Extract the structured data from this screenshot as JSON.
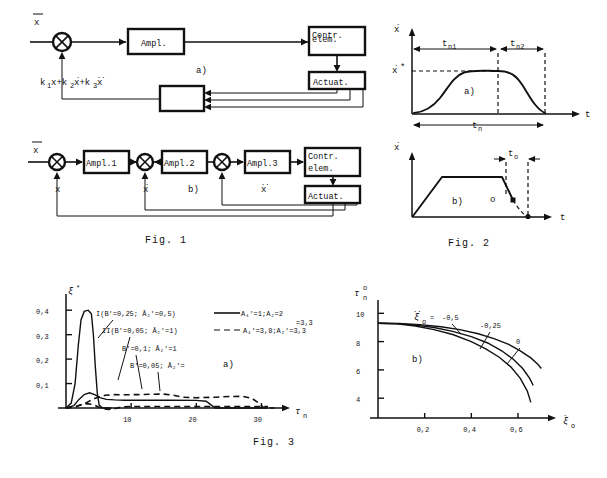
{
  "page": {
    "background": "#ffffff",
    "ink": "#111111"
  },
  "figures": [
    {
      "id": "fig1",
      "caption": "Fig. 1",
      "diagrams": [
        {
          "id": "fig1a",
          "panel_label": "a)",
          "input_label": "x̄",
          "blocks": [
            "Ampl.",
            "Contr.\nelem.",
            "Actuat."
          ],
          "block_ampl": "Ampl.",
          "block_contr_line1": "Contr.",
          "block_contr_line2": "elem.",
          "block_actuat": "Actuat.",
          "feedback_expression": "k₁x+k₂ẋ+k₃ẍ",
          "feedback_terms": [
            "k1x",
            "k2xdot",
            "k3xddot"
          ]
        },
        {
          "id": "fig1b",
          "panel_label": "b)",
          "input_label": "x̄",
          "block_ampl1": "Ampl.1",
          "block_ampl2": "Ampl.2",
          "block_ampl3": "Ampl.3",
          "block_contr_line1": "Contr.",
          "block_contr_line2": "elem.",
          "block_actuat": "Actuat.",
          "feedback_labels": [
            "x",
            "ẋ",
            "ẍ"
          ]
        }
      ]
    },
    {
      "id": "fig2",
      "caption": "Fig. 2",
      "plots": [
        {
          "id": "fig2a",
          "panel_label": "a)",
          "ylabel": "ẋ",
          "xlabel": "t",
          "level_label": "ẋ*",
          "span_labels": [
            "tₙ₁",
            "tₙ₂",
            "tₙ"
          ],
          "span_n1": "t",
          "span_n1_sub": "n1",
          "span_n2": "t",
          "span_n2_sub": "n2",
          "span_total": "t",
          "span_total_sub": "n"
        },
        {
          "id": "fig2b",
          "panel_label": "b)",
          "ylabel": "ẋ",
          "xlabel": "t",
          "overshoot_label": "t",
          "overshoot_sub": "o",
          "point_label": "o"
        }
      ]
    },
    {
      "id": "fig3",
      "caption": "Fig. 3"
    }
  ],
  "chart_data": [
    {
      "id": "fig3a",
      "type": "line",
      "panel_label": "a)",
      "title": "",
      "xlabel": "τₙ",
      "ylabel": "ξ*",
      "xlim": [
        0,
        33
      ],
      "ylim": [
        0,
        0.45
      ],
      "xticks": [
        10,
        20,
        30
      ],
      "xtick_labels": [
        "10",
        "20",
        "30"
      ],
      "yticks": [
        0.1,
        0.2,
        0.3,
        0.4
      ],
      "ytick_labels": [
        "0,1",
        "0,2",
        "0,3",
        "0,4"
      ],
      "grid": false,
      "annotations": [
        {
          "key": "ann1",
          "text": "I(B′=0,25;  Ā₂′=0,5)"
        },
        {
          "key": "ann2",
          "text": "II(B′=0,05;  Ā₂′=1)"
        },
        {
          "key": "ann3",
          "text": "B′=0,1;  Ā₂′=1"
        },
        {
          "key": "ann4",
          "text": "B′=0,05;  Ā₂′="
        }
      ],
      "legend_position": "top-right",
      "legend": [
        {
          "key": "leg1",
          "style": "solid",
          "text": "A₁′=1;A₂=2"
        },
        {
          "key": "leg2",
          "style": "dashed",
          "text": "A₁′=3,8;A₂′=3,3"
        }
      ],
      "series": [
        {
          "name": "I solid peak",
          "style": "solid",
          "points": [
            [
              0,
              0
            ],
            [
              0.8,
              0.02
            ],
            [
              1.4,
              0.1
            ],
            [
              1.9,
              0.26
            ],
            [
              2.3,
              0.36
            ],
            [
              2.8,
              0.395
            ],
            [
              3.4,
              0.4
            ],
            [
              3.9,
              0.385
            ],
            [
              4.2,
              0.3
            ],
            [
              4.5,
              0.17
            ],
            [
              4.8,
              0.06
            ],
            [
              5.1,
              0.012
            ],
            [
              5.6,
              0.0
            ],
            [
              7,
              0.0
            ]
          ]
        },
        {
          "name": "II solid small peak",
          "style": "solid",
          "points": [
            [
              0,
              0
            ],
            [
              1.2,
              0.01
            ],
            [
              2.0,
              0.035
            ],
            [
              2.8,
              0.055
            ],
            [
              3.6,
              0.062
            ],
            [
              4.4,
              0.055
            ],
            [
              5.2,
              0.042
            ],
            [
              6.2,
              0.035
            ],
            [
              7.5,
              0.033
            ],
            [
              9,
              0.032
            ],
            [
              12,
              0.032
            ],
            [
              16,
              0.032
            ],
            [
              20,
              0.031
            ],
            [
              21.5,
              0.028
            ],
            [
              22.3,
              0.012
            ],
            [
              22.9,
              0.0
            ],
            [
              31,
              0.0
            ]
          ]
        },
        {
          "name": "dashed upper plateau",
          "style": "dashed",
          "points": [
            [
              0,
              0
            ],
            [
              1.5,
              0.005
            ],
            [
              3,
              0.02
            ],
            [
              4.5,
              0.04
            ],
            [
              6,
              0.052
            ],
            [
              7.5,
              0.055
            ],
            [
              9,
              0.054
            ],
            [
              11,
              0.055
            ],
            [
              13,
              0.056
            ],
            [
              15,
              0.057
            ],
            [
              16.5,
              0.052
            ],
            [
              18,
              0.044
            ],
            [
              20,
              0.042
            ],
            [
              23,
              0.044
            ],
            [
              25,
              0.047
            ],
            [
              27,
              0.048
            ],
            [
              28.5,
              0.04
            ],
            [
              29.6,
              0.02
            ],
            [
              30.4,
              0.0
            ],
            [
              32,
              0.0
            ]
          ]
        },
        {
          "name": "dashed low trace",
          "style": "dashed",
          "points": [
            [
              0,
              0
            ],
            [
              1.2,
              0.004
            ],
            [
              2.2,
              0.012
            ],
            [
              3.2,
              0.018
            ],
            [
              4.2,
              0.014
            ],
            [
              5,
              0.004
            ],
            [
              5.8,
              -0.004
            ],
            [
              6.6,
              -0.006
            ],
            [
              7.6,
              -0.002
            ],
            [
              8.6,
              0.004
            ],
            [
              10,
              0.006
            ],
            [
              13,
              0.006
            ],
            [
              17,
              0.006
            ],
            [
              21,
              0.006
            ],
            [
              25,
              0.006
            ],
            [
              29,
              0.006
            ],
            [
              31,
              0.006
            ]
          ]
        }
      ]
    },
    {
      "id": "fig3b",
      "type": "line",
      "panel_label": "b)",
      "title": "",
      "xlabel": "ξ̇ₒ",
      "ylabel": "τₙ⁰",
      "xlim": [
        0,
        0.72
      ],
      "ylim": [
        2.6,
        10.8
      ],
      "xticks": [
        0.2,
        0.4,
        0.6
      ],
      "xtick_labels": [
        "0,2",
        "0,4",
        "0,6"
      ],
      "yticks": [
        4,
        6,
        8,
        10
      ],
      "ytick_labels": [
        "4",
        "6",
        "8",
        "10"
      ],
      "grid": false,
      "curve_group_label": "ξ̈ₒ  =",
      "curve_labels": [
        "-0,5",
        "-0,25",
        "0"
      ],
      "series": [
        {
          "name": "xi_dd = -0,5",
          "label": "-0,5",
          "points": [
            [
              0,
              9.3
            ],
            [
              0.08,
              9.25
            ],
            [
              0.16,
              9.1
            ],
            [
              0.24,
              8.85
            ],
            [
              0.32,
              8.5
            ],
            [
              0.4,
              8.0
            ],
            [
              0.46,
              7.5
            ],
            [
              0.52,
              6.9
            ],
            [
              0.57,
              6.2
            ],
            [
              0.61,
              5.4
            ],
            [
              0.64,
              4.5
            ],
            [
              0.655,
              3.7
            ]
          ]
        },
        {
          "name": "xi_dd = -0,25",
          "label": "-0,25",
          "points": [
            [
              0,
              9.3
            ],
            [
              0.08,
              9.27
            ],
            [
              0.16,
              9.17
            ],
            [
              0.24,
              9.0
            ],
            [
              0.32,
              8.72
            ],
            [
              0.4,
              8.35
            ],
            [
              0.47,
              7.9
            ],
            [
              0.53,
              7.35
            ],
            [
              0.58,
              6.75
            ],
            [
              0.62,
              6.1
            ],
            [
              0.65,
              5.4
            ],
            [
              0.665,
              4.9
            ]
          ]
        },
        {
          "name": "xi_dd = 0",
          "label": "0",
          "points": [
            [
              0,
              9.3
            ],
            [
              0.09,
              9.28
            ],
            [
              0.18,
              9.2
            ],
            [
              0.27,
              9.05
            ],
            [
              0.35,
              8.85
            ],
            [
              0.43,
              8.55
            ],
            [
              0.5,
              8.2
            ],
            [
              0.56,
              7.8
            ],
            [
              0.61,
              7.35
            ],
            [
              0.655,
              6.85
            ],
            [
              0.685,
              6.4
            ],
            [
              0.7,
              6.1
            ]
          ]
        }
      ]
    }
  ]
}
